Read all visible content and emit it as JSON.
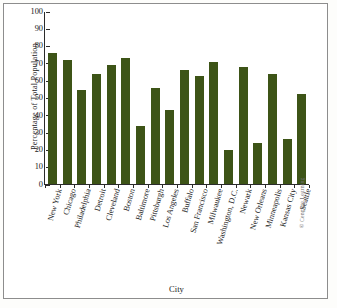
{
  "chart_data": {
    "type": "bar",
    "title": "",
    "xlabel": "City",
    "ylabel": "Percentage of  Total Population",
    "ylim": [
      0,
      100
    ],
    "yticks": [
      0,
      10,
      20,
      30,
      40,
      50,
      60,
      70,
      80,
      90,
      100
    ],
    "grid": false,
    "legend": null,
    "bar_color": "#3d5417",
    "categories": [
      "New York",
      "Chicago",
      "Philadelphia",
      "Detroit",
      "Cleveland",
      "Boston",
      "Baltimore",
      "Pittsburgh",
      "Los Angeles",
      "Buffalo",
      "San Francisco",
      "Milwaukee",
      "Washington, D.C.",
      "Newark",
      "New Orleans",
      "Minneapolis",
      "Kansas City",
      "Seattle"
    ],
    "values": [
      76,
      72,
      54.5,
      64,
      69,
      73.5,
      33.5,
      56,
      43,
      66,
      63,
      71,
      20,
      68,
      24,
      64,
      26,
      52.5
    ]
  },
  "credit": "© Cengage Learning"
}
